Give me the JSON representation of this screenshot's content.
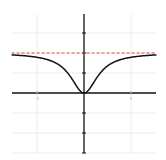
{
  "chart_data": {
    "type": "line",
    "title": "",
    "xlabel": "",
    "ylabel": "",
    "xlim": [
      -7.7,
      7.7
    ],
    "ylim": [
      -3,
      4
    ],
    "grid": true,
    "x_ticks": [
      -5,
      5
    ],
    "x_tick_labels": [
      "-5",
      "5"
    ],
    "y_ticks": [
      -3,
      -2,
      -1,
      1,
      2,
      3
    ],
    "series": [
      {
        "name": "f(x)",
        "color": "#111111",
        "style": "solid",
        "function": "2x^2/(x^2+3)",
        "x": [
          -7.7,
          -7,
          -6,
          -5,
          -4,
          -3,
          -2,
          -1.5,
          -1,
          -0.5,
          0,
          0.5,
          1,
          1.5,
          2,
          3,
          4,
          5,
          6,
          7,
          7.7
        ],
        "y": [
          1.91,
          1.89,
          1.85,
          1.79,
          1.68,
          1.5,
          1.14,
          0.86,
          0.5,
          0.15,
          0,
          0.15,
          0.5,
          0.86,
          1.14,
          1.5,
          1.68,
          1.79,
          1.85,
          1.89,
          1.91
        ]
      },
      {
        "name": "asymptote y=2",
        "color": "#e0503c",
        "style": "dashed",
        "x": [
          -7.7,
          7.7
        ],
        "y": [
          2,
          2
        ]
      }
    ]
  },
  "layout": {
    "origin_px": [
      84,
      93
    ],
    "x_unit_px": 9.4,
    "y_unit_px": 20,
    "plot_left_px": 12,
    "plot_right_px": 156,
    "plot_top_px": 14,
    "plot_bottom_px": 153
  }
}
